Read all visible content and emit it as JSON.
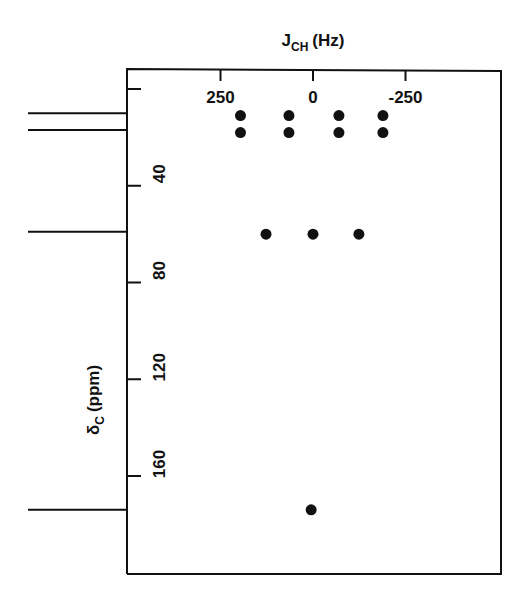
{
  "chart_data": {
    "type": "scatter",
    "title": "",
    "xlabel": "J_CH (Hz)",
    "xlabel_main": "J",
    "xlabel_sub": "CH",
    "xlabel_unit": "(Hz)",
    "ylabel": "δC (ppm)",
    "ylabel_main": "δ",
    "ylabel_sub": "C",
    "ylabel_unit": "(ppm)",
    "x_ticks": [
      250,
      0,
      -250
    ],
    "x_tick_labels": [
      "250",
      "0",
      "-250"
    ],
    "y_ticks": [
      0,
      40,
      80,
      120,
      160
    ],
    "y_tick_labels": [
      "",
      "40",
      "80",
      "120",
      "160"
    ],
    "xlim": [
      380,
      -510
    ],
    "ylim": [
      -8,
      200
    ],
    "x_axis_position": "top",
    "y_axis_inverted": true,
    "grid": false,
    "legend": null,
    "spectrum_lines_ppm": [
      10,
      17,
      59,
      174
    ],
    "points": [
      {
        "x": 196,
        "y": 11
      },
      {
        "x": 65,
        "y": 11
      },
      {
        "x": -70,
        "y": 11
      },
      {
        "x": -189,
        "y": 11
      },
      {
        "x": 196,
        "y": 18
      },
      {
        "x": 65,
        "y": 18
      },
      {
        "x": -70,
        "y": 18
      },
      {
        "x": -189,
        "y": 18
      },
      {
        "x": 127,
        "y": 60
      },
      {
        "x": 0,
        "y": 60
      },
      {
        "x": -124,
        "y": 60
      },
      {
        "x": 5,
        "y": 174
      }
    ]
  }
}
